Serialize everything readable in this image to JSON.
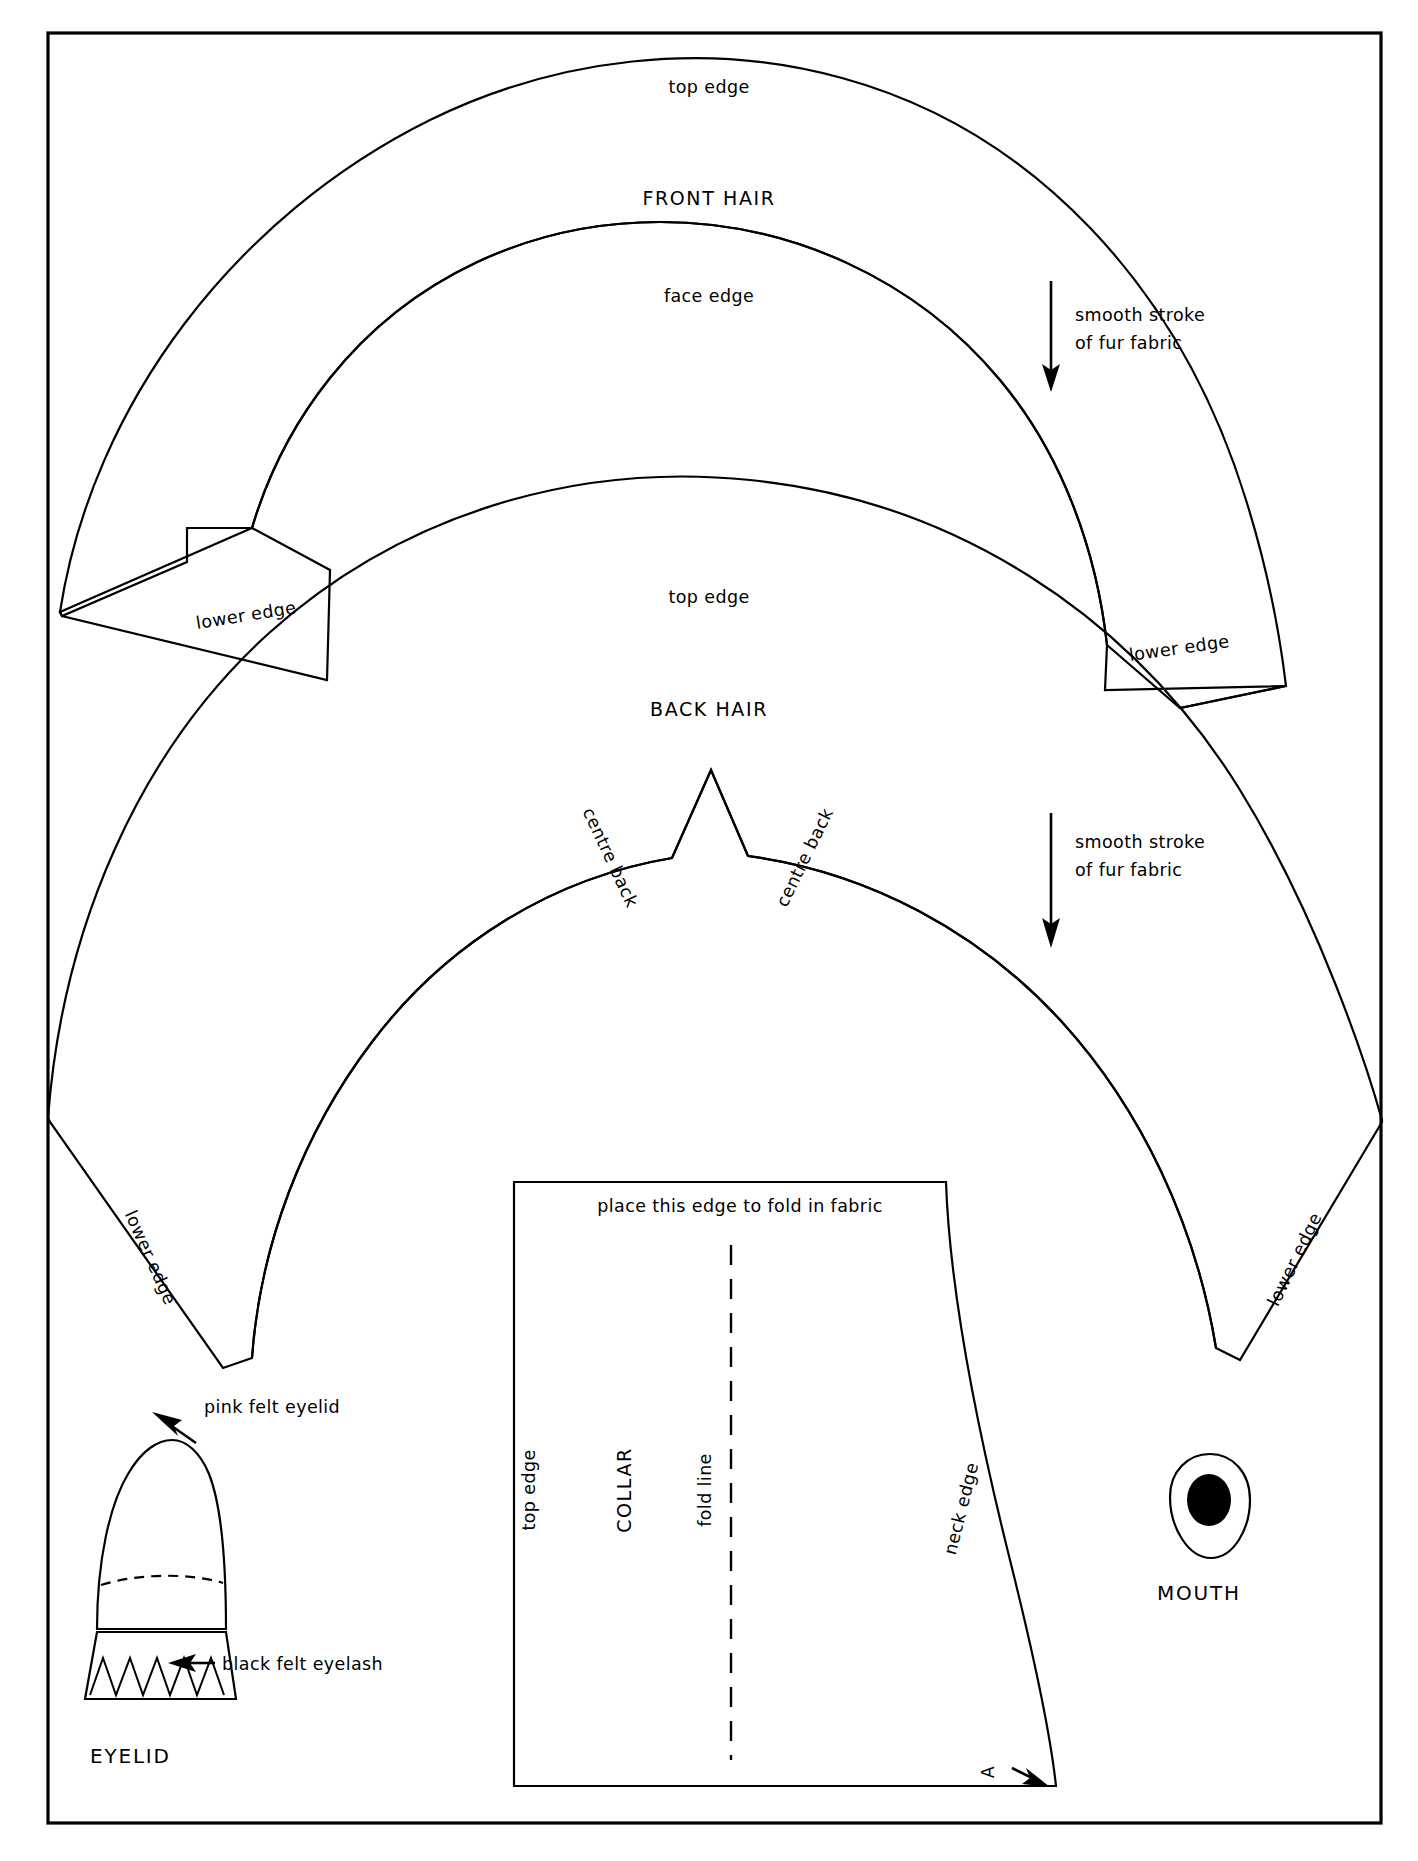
{
  "document": {
    "type": "sewing-pattern-sheet",
    "title": "Doll Hair, Collar, Eyelid and Mouth Pattern Pieces",
    "background_color": "#ffffff",
    "ink_color": "#000000"
  },
  "pieces": {
    "front_hair": {
      "name": "FRONT HAIR",
      "top_edge_label": "top edge",
      "face_edge_label": "face edge",
      "lower_edge_left_label": "lower edge",
      "lower_edge_right_label": "lower edge",
      "grain_note_line1": "smooth stroke",
      "grain_note_line2": "of fur fabric"
    },
    "back_hair": {
      "name": "BACK HAIR",
      "top_edge_label": "top edge",
      "centre_back_left_label": "centre back",
      "centre_back_right_label": "centre back",
      "lower_edge_left_label": "lower edge",
      "lower_edge_right_label": "lower edge",
      "grain_note_line1": "smooth stroke",
      "grain_note_line2": "of fur fabric"
    },
    "collar": {
      "name": "COLLAR",
      "fold_instruction": "place this edge to fold in fabric",
      "fold_line_label": "fold line",
      "top_edge_label": "top edge",
      "neck_edge_label": "neck edge",
      "notch_marker": "A"
    },
    "eyelid": {
      "name": "EYELID",
      "callout_top": "pink felt eyelid",
      "callout_bottom": "black felt eyelash"
    },
    "mouth": {
      "name": "MOUTH"
    }
  },
  "icons": {
    "grain_arrow": "down-arrow-icon",
    "callout_arrow": "pointer-arrow-icon",
    "notch_arrow": "notch-arrow-icon"
  }
}
